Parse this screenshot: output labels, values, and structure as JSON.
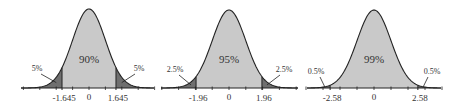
{
  "chart_data": [
    {
      "type": "area",
      "title": "",
      "distribution": "standard normal",
      "central_label": "90%",
      "central_area_pct": 90,
      "tail_labels": [
        "5%",
        "5%"
      ],
      "tail_area_pct": [
        5,
        5
      ],
      "critical_values": [
        -1.645,
        1.645
      ],
      "tick_labels": [
        "-1.645",
        "0",
        "1.645"
      ],
      "xlim": [
        -4,
        4
      ],
      "grid": false
    },
    {
      "type": "area",
      "title": "",
      "distribution": "standard normal",
      "central_label": "95%",
      "central_area_pct": 95,
      "tail_labels": [
        "2.5%",
        "2.5%"
      ],
      "tail_area_pct": [
        2.5,
        2.5
      ],
      "critical_values": [
        -1.96,
        1.96
      ],
      "tick_labels": [
        "-1.96",
        "0",
        "1.96"
      ],
      "xlim": [
        -4,
        4
      ],
      "grid": false
    },
    {
      "type": "area",
      "title": "",
      "distribution": "standard normal",
      "central_label": "99%",
      "central_area_pct": 99,
      "tail_labels": [
        "0.5%",
        "0.5%"
      ],
      "tail_area_pct": [
        0.5,
        0.5
      ],
      "critical_values": [
        -2.58,
        2.58
      ],
      "tick_labels": [
        "-2.58",
        "0",
        "2.58"
      ],
      "xlim": [
        -4,
        4
      ],
      "grid": false
    }
  ],
  "colors": {
    "central_fill": "#c9c9c9",
    "tail_fill": "#6f6f6f",
    "curve": "#222222",
    "axis": "#222222"
  },
  "panels": [
    {
      "center": "90%",
      "left_tail": "5%",
      "right_tail": "5%",
      "lo": "-1.645",
      "mid": "0",
      "hi": "1.645"
    },
    {
      "center": "95%",
      "left_tail": "2.5%",
      "right_tail": "2.5%",
      "lo": "-1.96",
      "mid": "0",
      "hi": "1.96"
    },
    {
      "center": "99%",
      "left_tail": "0.5%",
      "right_tail": "0.5%",
      "lo": "-2.58",
      "mid": "0",
      "hi": "2.58"
    }
  ]
}
